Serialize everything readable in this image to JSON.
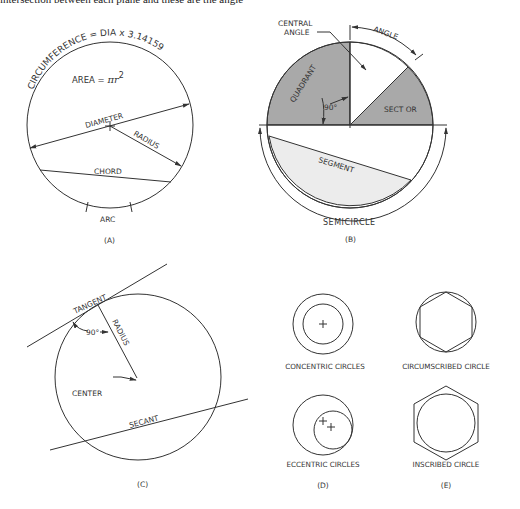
{
  "caption_top": "intersection between each plane and these are the angle",
  "panel_a": {
    "label": "(A)",
    "circumference": "CIRCUMFERENCE = DIA x 3.14159",
    "area_prefix": "AREA = ",
    "area_formula": "πr",
    "area_exp": "2",
    "diameter": "DIAMETER",
    "radius": "RADIUS",
    "chord": "CHORD",
    "arc": "ARC"
  },
  "panel_b": {
    "label": "(B)",
    "central_angle_1": "CENTRAL",
    "central_angle_2": "ANGLE",
    "angle": "ANGLE",
    "quadrant": "QUADRANT",
    "ninety": "90°",
    "sector": "SECT OR",
    "segment": "SEGMENT",
    "semicircle": "SEMICIRCLE",
    "colors": {
      "dark": "#a9a9a9",
      "light": "#ececec"
    }
  },
  "panel_c": {
    "label": "(C)",
    "tangent": "TANGENT",
    "radius": "RADIUS",
    "ninety": "90°",
    "center": "CENTER",
    "secant": "SECANT"
  },
  "panel_d": {
    "label": "(D)",
    "concentric": "CONCENTRIC CIRCLES",
    "eccentric": "ECCENTRIC CIRCLES"
  },
  "panel_e": {
    "label": "(E)",
    "circumscribed": "CIRCUMSCRIBED CIRCLE",
    "inscribed": "INSCRIBED CIRCLE"
  }
}
